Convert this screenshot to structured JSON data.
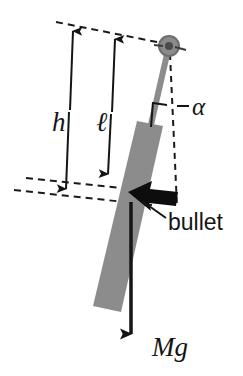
{
  "figure": {
    "background_color": "#ffffff",
    "width": 243,
    "height": 376
  },
  "colors": {
    "rod_gray": "#8c8c8c",
    "bar_gray": "#8c8c8c",
    "pivot_gray": "#7e7e7e",
    "pivot_ring_dark": "#5a5a5a",
    "ink_black": "#151515",
    "dashed_black": "#1a1a1a"
  },
  "labels": {
    "height_h": "h",
    "length_l": "ℓ",
    "angle_alpha": "α",
    "bullet": "bullet",
    "weight": "Mg"
  },
  "elements": {
    "pivot": {
      "name": "pivot-hinge",
      "cx": 169,
      "cy": 46,
      "r_outer": 10,
      "r_inner": 4
    },
    "thin_rod": {
      "name": "thin-rod",
      "x1": 167,
      "y1": 52,
      "x2": 150,
      "y2": 128,
      "width": 6
    },
    "bar": {
      "name": "pendulum-bar",
      "top_left_x": 137,
      "top_left_y": 122,
      "top_right_x": 163,
      "top_right_y": 127,
      "bottom_right_x": 120,
      "bottom_right_y": 311,
      "bottom_left_x": 92,
      "bottom_left_y": 306
    },
    "vertical_dashed": {
      "name": "vertical-reference-line",
      "x1": 170,
      "y1": 52,
      "x2": 177,
      "y2": 205
    },
    "angle_tick": {
      "name": "angle-tick-mark",
      "x1": 150,
      "y1": 128,
      "x2": 152,
      "y2": 103
    },
    "bullet_arrow": {
      "name": "bullet-arrow",
      "tip_x": 131,
      "tip_y": 193,
      "tail_x": 176,
      "tail_y": 200
    },
    "bullet_leader": {
      "name": "bullet-leader-line",
      "x1": 141,
      "y1": 200,
      "x2": 163,
      "y2": 215
    },
    "weight_arrow": {
      "name": "weight-arrow",
      "x1": 131,
      "y1": 201,
      "x2": 131,
      "y2": 340
    },
    "h_arrow": {
      "name": "h-dimension-arrow",
      "x_top": 72,
      "y_top": 28,
      "x_bottom": 66,
      "y_bottom": 192
    },
    "l_arrow": {
      "name": "l-dimension-arrow",
      "x_top": 114,
      "y_top": 36,
      "x_bottom": 108,
      "y_bottom": 176
    },
    "top_dashed": {
      "name": "top-dashed-guide",
      "x1": 56,
      "y1": 22,
      "x2": 167,
      "y2": 44
    },
    "l_dashed": {
      "name": "l-bottom-dashed-guide",
      "x1": 26,
      "y1": 178,
      "x2": 140,
      "y2": 190
    },
    "h_dashed": {
      "name": "h-bottom-dashed-guide",
      "x1": 14,
      "y1": 190,
      "x2": 152,
      "y2": 205
    }
  }
}
